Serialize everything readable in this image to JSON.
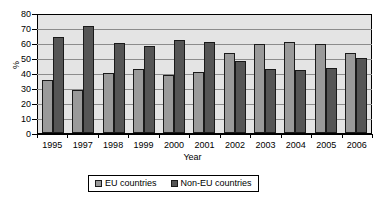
{
  "chart_data": {
    "type": "bar",
    "title": "",
    "xlabel": "Year",
    "ylabel": "%",
    "ylim": [
      0,
      80
    ],
    "ytick_step": 10,
    "yticks": [
      0,
      10,
      20,
      30,
      40,
      50,
      60,
      70,
      80
    ],
    "grid": true,
    "legend_position": "bottom",
    "categories": [
      "1995",
      "1997",
      "1998",
      "1999",
      "2000",
      "2001",
      "2002",
      "2003",
      "2004",
      "2005",
      "2006"
    ],
    "series": [
      {
        "name": "EU countries",
        "color": "#9a9a9a",
        "values": [
          36,
          29,
          40.5,
          43.5,
          39.5,
          41.5,
          54.5,
          60.5,
          61.5,
          60.5,
          54
        ]
      },
      {
        "name": "Non-EU countries",
        "color": "#555555",
        "values": [
          65,
          72.5,
          61,
          59,
          63,
          61.5,
          49,
          43.5,
          43,
          44,
          51
        ]
      }
    ]
  },
  "legend": {
    "items": [
      {
        "label": "EU countries",
        "swatch": "eu-swatch-icon"
      },
      {
        "label": "Non-EU countries",
        "swatch": "non-eu-swatch-icon"
      }
    ]
  },
  "colors": {
    "plot_background": "#e4e4e4",
    "gridline": "#8c8c8c",
    "axis": "#000000",
    "series_eu": "#9a9a9a",
    "series_non_eu": "#555555",
    "page_background": "#ffffff"
  }
}
